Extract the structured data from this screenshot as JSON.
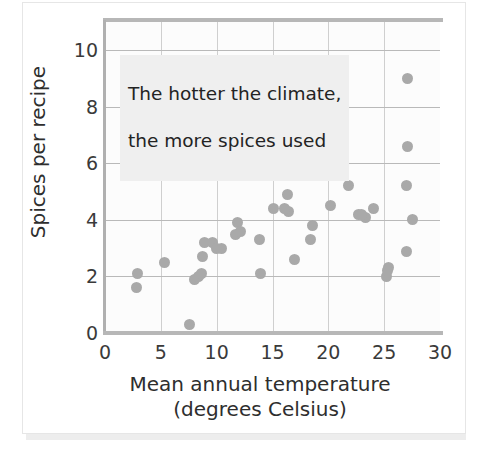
{
  "chart_data": {
    "type": "scatter",
    "title": "",
    "xlabel": "Mean annual temperature\n(degrees Celsius)",
    "xlabel_line1": "Mean annual temperature",
    "xlabel_line2": "(degrees Celsius)",
    "ylabel": "Spices per recipe",
    "xlim": [
      0,
      30
    ],
    "ylim": [
      0,
      11
    ],
    "xticks": [
      0,
      5,
      10,
      15,
      20,
      25,
      30
    ],
    "yticks": [
      0,
      2,
      4,
      6,
      8,
      10
    ],
    "xtick_labels": [
      "0",
      "5",
      "10",
      "15",
      "20",
      "25",
      "30"
    ],
    "ytick_labels": [
      "0",
      "2",
      "4",
      "6",
      "8",
      "10"
    ],
    "grid": "both",
    "legend": "none",
    "marker_color": "#a9a9a9",
    "annotations": [
      {
        "text": "The hotter the climate,\nthe more spices used",
        "line1": "The hotter the climate,",
        "line2": "the more spices used",
        "x": 1.1,
        "y": 9.6,
        "background": "#efefef"
      }
    ],
    "points": [
      {
        "x": 2.9,
        "y": 2.1
      },
      {
        "x": 2.8,
        "y": 1.6
      },
      {
        "x": 5.3,
        "y": 2.5
      },
      {
        "x": 7.6,
        "y": 0.3
      },
      {
        "x": 8.0,
        "y": 1.9
      },
      {
        "x": 8.4,
        "y": 2.0
      },
      {
        "x": 8.6,
        "y": 2.1
      },
      {
        "x": 8.7,
        "y": 2.7
      },
      {
        "x": 8.9,
        "y": 3.2
      },
      {
        "x": 9.6,
        "y": 3.2
      },
      {
        "x": 10.0,
        "y": 3.0
      },
      {
        "x": 10.4,
        "y": 3.0
      },
      {
        "x": 11.7,
        "y": 3.5
      },
      {
        "x": 11.9,
        "y": 3.9
      },
      {
        "x": 12.1,
        "y": 3.6
      },
      {
        "x": 13.9,
        "y": 2.1
      },
      {
        "x": 13.8,
        "y": 3.3
      },
      {
        "x": 15.1,
        "y": 4.4
      },
      {
        "x": 16.3,
        "y": 4.9
      },
      {
        "x": 16.4,
        "y": 4.3
      },
      {
        "x": 16.1,
        "y": 4.4
      },
      {
        "x": 17.0,
        "y": 2.6
      },
      {
        "x": 18.5,
        "y": 5.7
      },
      {
        "x": 18.6,
        "y": 3.8
      },
      {
        "x": 18.4,
        "y": 3.3
      },
      {
        "x": 20.2,
        "y": 4.5
      },
      {
        "x": 21.3,
        "y": 7.3
      },
      {
        "x": 21.8,
        "y": 5.2
      },
      {
        "x": 22.7,
        "y": 4.2
      },
      {
        "x": 23.3,
        "y": 4.1
      },
      {
        "x": 23.0,
        "y": 4.2
      },
      {
        "x": 24.0,
        "y": 4.4
      },
      {
        "x": 25.2,
        "y": 2.0
      },
      {
        "x": 25.4,
        "y": 2.3
      },
      {
        "x": 25.3,
        "y": 2.2
      },
      {
        "x": 27.1,
        "y": 9.0
      },
      {
        "x": 27.1,
        "y": 6.6
      },
      {
        "x": 27.0,
        "y": 5.2
      },
      {
        "x": 27.5,
        "y": 4.0
      },
      {
        "x": 27.0,
        "y": 2.9
      }
    ]
  }
}
